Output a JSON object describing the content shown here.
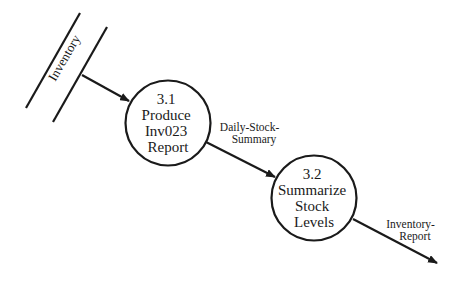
{
  "diagram": {
    "type": "data-flow-diagram",
    "data_store": {
      "label": "Inventory"
    },
    "processes": [
      {
        "id": "3.1",
        "lines": [
          "3.1",
          "Produce",
          "Inv023",
          "Report"
        ]
      },
      {
        "id": "3.2",
        "lines": [
          "3.2",
          "Summarize",
          "Stock",
          "Levels"
        ]
      }
    ],
    "flows": [
      {
        "from": "Inventory",
        "to": "3.1",
        "lines": []
      },
      {
        "from": "3.1",
        "to": "3.2",
        "lines": [
          "Daily-Stock-",
          "Summary"
        ]
      },
      {
        "from": "3.2",
        "to": "external",
        "lines": [
          "Inventory-",
          "Report"
        ]
      }
    ],
    "colors": {
      "stroke": "#1a1a1a",
      "background": "#ffffff"
    }
  }
}
